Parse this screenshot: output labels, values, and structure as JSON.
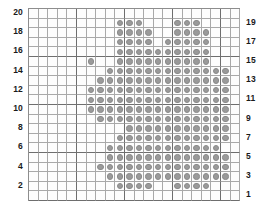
{
  "chart_data": {
    "type": "heatmap",
    "title": "",
    "xlabel": "",
    "ylabel": "",
    "columns": 22,
    "rows": 20,
    "grid_on": true,
    "legend_position": "none",
    "dot_color": "#9a9a9a",
    "grid_color": "#a9a9a9",
    "major_grid_color": "#6e6e6e",
    "background_color": "#fdfdfd",
    "major_every": 5,
    "left_axis_labels": [
      "20",
      "18",
      "16",
      "14",
      "12",
      "10",
      "8",
      "6",
      "4",
      "2"
    ],
    "right_axis_labels": [
      "19",
      "17",
      "15",
      "13",
      "11",
      "9",
      "7",
      "5",
      "3",
      "1"
    ],
    "left_axis_rows": [
      20,
      18,
      16,
      14,
      12,
      10,
      8,
      6,
      4,
      2
    ],
    "right_axis_rows": [
      19,
      17,
      15,
      13,
      11,
      9,
      7,
      5,
      3,
      1
    ],
    "row_order_top_to_bottom": [
      20,
      19,
      18,
      17,
      16,
      15,
      14,
      13,
      12,
      11,
      10,
      9,
      8,
      7,
      6,
      5,
      4,
      3,
      2,
      1
    ],
    "filled_cells_by_row": {
      "20": [],
      "19": [
        10,
        11,
        12,
        16,
        17,
        18
      ],
      "18": [
        10,
        11,
        12,
        13,
        16,
        17,
        18,
        19
      ],
      "17": [
        10,
        11,
        12,
        13,
        15,
        16,
        17,
        18,
        19
      ],
      "16": [
        10,
        11,
        12,
        13,
        14,
        15,
        16,
        17,
        18,
        19
      ],
      "15": [
        7,
        10,
        11,
        12,
        13,
        14,
        15,
        16,
        17,
        18,
        19
      ],
      "14": [
        9,
        10,
        11,
        12,
        13,
        14,
        15,
        16,
        17,
        18,
        19,
        20,
        21
      ],
      "13": [
        8,
        9,
        10,
        11,
        12,
        13,
        14,
        15,
        16,
        17,
        18,
        19,
        20,
        21
      ],
      "12": [
        7,
        8,
        9,
        10,
        11,
        12,
        13,
        14,
        15,
        16,
        17,
        18,
        19,
        20,
        21
      ],
      "11": [
        7,
        8,
        9,
        10,
        11,
        12,
        13,
        14,
        15,
        16,
        17,
        18,
        19,
        20,
        21
      ],
      "10": [
        7,
        8,
        9,
        10,
        11,
        12,
        13,
        14,
        15,
        16,
        17,
        18,
        19,
        20,
        21
      ],
      "9": [
        8,
        9,
        10,
        11,
        12,
        13,
        14,
        15,
        16,
        17,
        18,
        19,
        20,
        21
      ],
      "8": [
        11,
        12,
        13,
        14,
        15,
        16,
        17,
        18,
        19,
        20,
        21
      ],
      "7": [
        10,
        11,
        12,
        13,
        14,
        15,
        16,
        17,
        18,
        19,
        20,
        21
      ],
      "6": [
        9,
        10,
        11,
        12,
        13,
        14,
        15,
        16,
        17,
        18,
        19,
        20
      ],
      "5": [
        9,
        10,
        11,
        12,
        13,
        14,
        15,
        16,
        17,
        18,
        19,
        20,
        21
      ],
      "4": [
        8,
        9,
        10,
        11,
        12,
        13,
        14,
        15,
        16,
        17,
        18,
        19,
        20,
        21
      ],
      "3": [
        9,
        10,
        11,
        12,
        13,
        14,
        15,
        16,
        17,
        18,
        19,
        20,
        21
      ],
      "2": [
        10,
        11,
        12,
        13,
        16,
        17,
        18,
        19
      ],
      "1": []
    }
  }
}
